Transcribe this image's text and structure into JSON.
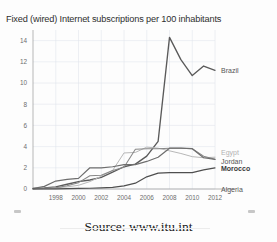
{
  "figure": {
    "title": "Fixed (wired) Internet subscriptions per 100 inhabitants",
    "source": "Source: www.itu.int",
    "background_color": "#fdfdfd",
    "grid_color": "#dfe3ea",
    "axis_color": "#9a9a9a"
  },
  "chart_data": {
    "type": "line",
    "title": "Fixed (wired) Internet subscriptions per 100 inhabitants",
    "xlabel": "",
    "ylabel": "",
    "xlim": [
      1996,
      2012
    ],
    "ylim": [
      0,
      15
    ],
    "grid": true,
    "legend_position": "right-inline-labels",
    "x": [
      1996,
      1997,
      1998,
      1999,
      2000,
      2001,
      2002,
      2003,
      2004,
      2005,
      2006,
      2007,
      2008,
      2009,
      2010,
      2011,
      2012
    ],
    "xticks": [
      1998,
      2000,
      2002,
      2004,
      2006,
      2008,
      2010,
      2012
    ],
    "xtick_labels": [
      "1998",
      "2000",
      "2002",
      "2004",
      "2006",
      "2008",
      "2010",
      "2012"
    ],
    "yticks": [
      0,
      2,
      4,
      6,
      8,
      10,
      12,
      14
    ],
    "ytick_labels": [
      "0",
      "2",
      "4",
      "6",
      "8",
      "10",
      "12",
      "14"
    ],
    "series": [
      {
        "name": "Brazil",
        "color": "#5a5a5a",
        "width": 1.35,
        "label_style": "normal",
        "values": [
          0.05,
          0.1,
          0.2,
          0.45,
          0.7,
          0.85,
          1.1,
          1.6,
          2.1,
          2.35,
          3.1,
          4.5,
          14.3,
          12.2,
          10.7,
          11.6,
          11.2
        ]
      },
      {
        "name": "Egypt",
        "color": "#b8b8b8",
        "width": 1.0,
        "label_style": "faint",
        "values": [
          0.02,
          0.05,
          0.1,
          0.2,
          0.35,
          0.7,
          1.2,
          1.75,
          3.4,
          3.45,
          3.95,
          3.85,
          3.6,
          3.35,
          3.05,
          2.95,
          3.0
        ]
      },
      {
        "name": "Jordan",
        "color": "#888888",
        "width": 1.05,
        "label_style": "normal",
        "values": [
          0.03,
          0.06,
          0.12,
          0.3,
          0.6,
          1.25,
          1.3,
          1.75,
          2.05,
          3.75,
          3.8,
          3.8,
          3.85,
          3.85,
          3.8,
          3.1,
          2.8
        ]
      },
      {
        "name": "Morocco",
        "color": "#6e6e6e",
        "width": 1.2,
        "label_style": "bold",
        "values": [
          0.05,
          0.25,
          0.75,
          0.9,
          1.0,
          2.0,
          2.0,
          2.1,
          2.3,
          2.3,
          2.6,
          3.0,
          3.85,
          3.85,
          3.8,
          2.95,
          2.8
        ]
      },
      {
        "name": "Algeria",
        "color": "#4f4f4f",
        "width": 1.2,
        "label_style": "normal",
        "values": [
          0.0,
          0.0,
          0.02,
          0.03,
          0.05,
          0.07,
          0.1,
          0.15,
          0.3,
          0.55,
          1.15,
          1.5,
          1.55,
          1.55,
          1.55,
          1.8,
          2.0
        ]
      }
    ],
    "annotations": [
      {
        "text": "Brazil",
        "value_at_end": 11.2,
        "style": "normal"
      },
      {
        "text": "Egypt",
        "value_at_end": 3.0,
        "style": "faint"
      },
      {
        "text": "Jordan",
        "value_at_end": 2.8,
        "style": "normal"
      },
      {
        "text": "Morocco",
        "value_at_end": 2.8,
        "style": "bold"
      },
      {
        "text": "Algeria",
        "value_at_end": 2.0,
        "style": "normal"
      }
    ]
  }
}
